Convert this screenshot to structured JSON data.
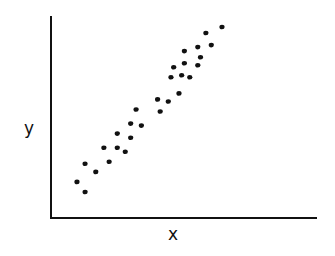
{
  "chart_data": {
    "type": "scatter",
    "title": "",
    "xlabel": "x",
    "ylabel": "y",
    "grid": false,
    "ticks": false,
    "legend": null,
    "xlim": [
      0,
      100
    ],
    "ylim": [
      0,
      100
    ],
    "points": [
      {
        "x": 10,
        "y": 18
      },
      {
        "x": 13,
        "y": 13
      },
      {
        "x": 13,
        "y": 27
      },
      {
        "x": 17,
        "y": 23
      },
      {
        "x": 20,
        "y": 35
      },
      {
        "x": 22,
        "y": 28
      },
      {
        "x": 25,
        "y": 35
      },
      {
        "x": 25,
        "y": 42
      },
      {
        "x": 28,
        "y": 33
      },
      {
        "x": 30,
        "y": 40
      },
      {
        "x": 30,
        "y": 47
      },
      {
        "x": 32,
        "y": 54
      },
      {
        "x": 34,
        "y": 46
      },
      {
        "x": 40,
        "y": 59
      },
      {
        "x": 41,
        "y": 53
      },
      {
        "x": 44,
        "y": 58
      },
      {
        "x": 48,
        "y": 62
      },
      {
        "x": 45,
        "y": 70
      },
      {
        "x": 46,
        "y": 75
      },
      {
        "x": 49,
        "y": 71
      },
      {
        "x": 50,
        "y": 77
      },
      {
        "x": 50,
        "y": 83
      },
      {
        "x": 52,
        "y": 70
      },
      {
        "x": 55,
        "y": 76
      },
      {
        "x": 56,
        "y": 80
      },
      {
        "x": 55,
        "y": 85
      },
      {
        "x": 58,
        "y": 92
      },
      {
        "x": 60,
        "y": 86
      },
      {
        "x": 64,
        "y": 95
      }
    ]
  },
  "labels": {
    "x": "x",
    "y": "y"
  }
}
